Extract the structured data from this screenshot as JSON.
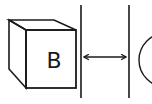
{
  "diagram": {
    "cube": {
      "label": "B"
    },
    "gap_arrow": {
      "type": "double-headed"
    },
    "colors": {
      "line": "#1a1a1a",
      "background": "#ffffff"
    }
  }
}
